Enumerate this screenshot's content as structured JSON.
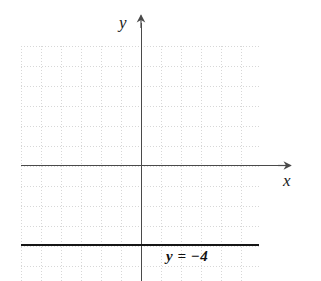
{
  "figure": {
    "kind": "coordinate-plane-graph",
    "background_color": "#ffffff",
    "grid": {
      "visible": true,
      "style": "dotted",
      "color": "#b8b8b8",
      "cell_size_px": 20,
      "columns": 12,
      "rows": 12
    }
  },
  "axes": {
    "x": {
      "label": "x",
      "color": "#4a4a4a",
      "arrow": "right"
    },
    "y": {
      "label": "y",
      "color": "#4a4a4a",
      "arrow": "up"
    },
    "origin_label": ""
  },
  "chart_data": {
    "type": "line",
    "title": "",
    "xlabel": "x",
    "ylabel": "y",
    "xlim": [
      -6,
      7
    ],
    "ylim": [
      -6,
      7
    ],
    "grid": true,
    "legend": "none",
    "annotations": [
      {
        "text": "y = −4",
        "x": 1.3,
        "y": -4.7,
        "style": "bold-italic"
      }
    ],
    "series": [
      {
        "name": "y = −4",
        "equation": "y = -4",
        "color": "#161616",
        "linewidth": 2.1,
        "x": [
          -6,
          -5,
          -4,
          -3,
          -2,
          -1,
          0,
          1,
          2,
          3,
          4,
          5,
          6
        ],
        "values": [
          -4,
          -4,
          -4,
          -4,
          -4,
          -4,
          -4,
          -4,
          -4,
          -4,
          -4,
          -4,
          -4
        ]
      }
    ]
  },
  "labels": {
    "function_equation": "y = −4"
  }
}
